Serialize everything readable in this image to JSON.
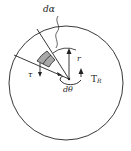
{
  "diagram": {
    "type": "torsion-element",
    "labels": {
      "d_alpha": "dα",
      "radius": "r",
      "shear": "τ",
      "torque": "T",
      "torque_sub": "R",
      "d_theta": "dθ"
    },
    "colors": {
      "stroke": "#222222",
      "shade": "#a8a8a8",
      "background": "#ffffff"
    }
  }
}
